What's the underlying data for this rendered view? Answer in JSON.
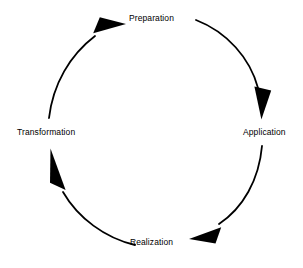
{
  "diagram": {
    "type": "circular-cycle",
    "direction": "clockwise",
    "background_color": "#ffffff",
    "stroke_color": "#000000",
    "text_color": "#000000",
    "nodes": [
      {
        "id": "preparation",
        "label": "Preparation",
        "position": "top"
      },
      {
        "id": "application",
        "label": "Application",
        "position": "right"
      },
      {
        "id": "realization",
        "label": "Realization",
        "position": "bottom"
      },
      {
        "id": "transformation",
        "label": "Transformation",
        "position": "left"
      }
    ],
    "arrows": [
      {
        "id": "arrow-preparation-to-application",
        "from": "Preparation",
        "to": "Application",
        "arrowhead": "down"
      },
      {
        "id": "arrow-application-to-realization",
        "from": "Application",
        "to": "Realization",
        "arrowhead": "left"
      },
      {
        "id": "arrow-realization-to-transformation",
        "from": "Realization",
        "to": "Transformation",
        "arrowhead": "up"
      },
      {
        "id": "arrow-transformation-to-preparation",
        "from": "Transformation",
        "to": "Preparation",
        "arrowhead": "up-right"
      }
    ]
  }
}
